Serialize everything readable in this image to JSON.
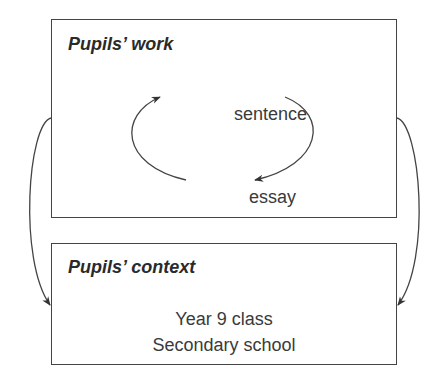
{
  "diagram": {
    "work_box": {
      "title": "Pupils’ work",
      "cycle": {
        "top_label": "sentence",
        "bottom_label": "essay",
        "direction": "sentence → essay (clockwise right side), essay → sentence (left side)"
      }
    },
    "context_box": {
      "title": "Pupils’ context",
      "lines": [
        "Year 9 class",
        "Secondary school"
      ]
    },
    "connectors": [
      {
        "from": "work_box",
        "to": "context_box",
        "side": "left"
      },
      {
        "from": "work_box",
        "to": "context_box",
        "side": "right"
      }
    ],
    "colors": {
      "line": "#444444",
      "text": "#2b2b2b",
      "background": "#ffffff"
    }
  }
}
